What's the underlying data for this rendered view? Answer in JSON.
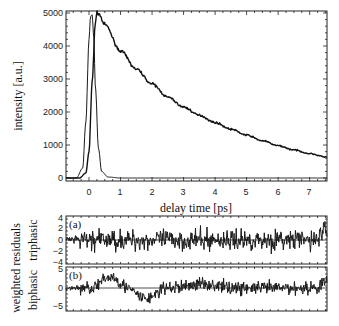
{
  "chart_data": [
    {
      "type": "line",
      "title": "",
      "xlabel": "delay time [ps]",
      "ylabel": "intensity [a.u.]",
      "xlim": [
        -0.73,
        7.55
      ],
      "ylim": [
        0,
        5100
      ],
      "x_ticks": [
        0,
        1,
        2,
        3,
        4,
        5,
        6,
        7
      ],
      "y_ticks": [
        0,
        1000,
        2000,
        3000,
        4000,
        5000
      ],
      "grid": false,
      "legend": null,
      "series": [
        {
          "name": "instrument response (pulse)",
          "x": [
            -0.7,
            -0.4,
            -0.2,
            -0.1,
            0.0,
            0.05,
            0.1,
            0.15,
            0.2,
            0.3,
            0.4,
            0.6,
            1.0,
            7.5
          ],
          "y": [
            0,
            0,
            300,
            1700,
            4200,
            4900,
            4950,
            4300,
            2800,
            900,
            200,
            30,
            0,
            0
          ]
        },
        {
          "name": "measured / fitted signal",
          "x": [
            -0.7,
            -0.3,
            -0.1,
            0.0,
            0.1,
            0.2,
            0.25,
            0.3,
            0.5,
            1.0,
            1.5,
            2.0,
            2.5,
            3.0,
            3.5,
            4.0,
            4.5,
            5.0,
            5.5,
            6.0,
            6.5,
            7.0,
            7.5
          ],
          "y": [
            0,
            0,
            150,
            800,
            2900,
            4700,
            5000,
            4980,
            4650,
            3850,
            3300,
            2850,
            2450,
            2150,
            1900,
            1680,
            1480,
            1300,
            1130,
            980,
            850,
            740,
            640
          ]
        }
      ]
    },
    {
      "type": "line",
      "title": "weighted residuals (a) triphasic",
      "panel_label": "(a)",
      "ylabel": "triphasic",
      "ylim": [
        -4,
        4
      ],
      "y_ticks": [
        -4,
        -2,
        0,
        2,
        4
      ],
      "xlim": [
        -0.73,
        7.55
      ],
      "description": "noise-like residuals fluctuating around 0, amplitude roughly ±2–3"
    },
    {
      "type": "line",
      "title": "weighted residuals (b) biphasic",
      "panel_label": "(b)",
      "ylabel": "biphasic",
      "ylim": [
        -6,
        5
      ],
      "y_ticks": [
        -5,
        0,
        5
      ],
      "xlim": [
        -0.73,
        7.55
      ],
      "description": "residuals around 0 with systematic deviation near early times (positive bump ~+3 around 0.5–1 ps, negative dip ~-3 around 1.5–2 ps)"
    }
  ],
  "main": {
    "xlabel": "delay time [ps]",
    "ylabel": "intensity [a.u.]",
    "x_tick_labels": [
      "0",
      "1",
      "2",
      "3",
      "4",
      "5",
      "6",
      "7"
    ],
    "y_tick_labels": [
      "0",
      "1000",
      "2000",
      "3000",
      "4000",
      "5000"
    ]
  },
  "residuals": {
    "group_label": "weighted residuals",
    "panel_a": {
      "tag": "(a)",
      "side_label": "triphasic",
      "y_tick_labels": [
        "4",
        "2",
        "0",
        "−2",
        "−4"
      ]
    },
    "panel_b": {
      "tag": "(b)",
      "side_label": "biphasic",
      "y_tick_labels": [
        "5",
        "0",
        "−5"
      ]
    }
  }
}
